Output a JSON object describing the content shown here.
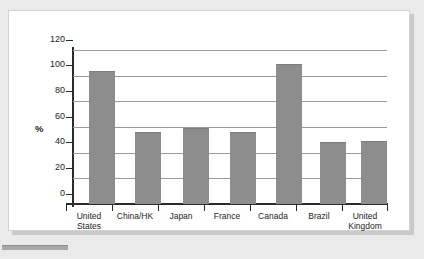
{
  "chart_data": {
    "type": "bar",
    "title": "",
    "subtitle": "",
    "xlabel": "",
    "ylabel": "%",
    "ylim": [
      0,
      120
    ],
    "yticks": [
      0,
      20,
      40,
      60,
      80,
      100,
      120
    ],
    "ytick_labels": [
      "0",
      "20",
      "40",
      "60",
      "80",
      "100",
      "120"
    ],
    "grid": true,
    "legend": false,
    "legend_position": "none",
    "categories": [
      "United States",
      "China/HK",
      "Japan",
      "France",
      "Canada",
      "Brazil",
      "United Kingdom"
    ],
    "category_lines": [
      [
        "United",
        "States"
      ],
      [
        "China/HK",
        ""
      ],
      [
        "Japan",
        ""
      ],
      [
        "France",
        ""
      ],
      [
        "Canada",
        ""
      ],
      [
        "Brazil",
        ""
      ],
      [
        "United",
        "Kingdom"
      ]
    ],
    "values": [
      104,
      56,
      59,
      56,
      109,
      48,
      49
    ],
    "bar_color": "#8d8d8d",
    "axis_color": "#2b2b2b",
    "gridline_color": "#9a9a9a",
    "plot_background": "#ffffff",
    "figure_background": "#eaeaea"
  }
}
